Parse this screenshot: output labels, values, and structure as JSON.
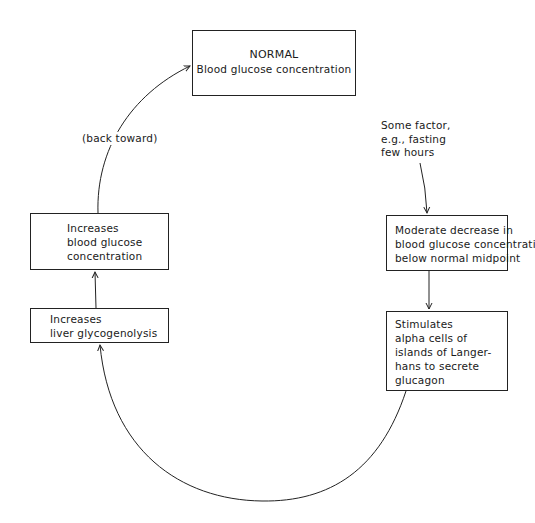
{
  "diagram": {
    "type": "feedback-loop",
    "nodes": {
      "normal": {
        "title": "NORMAL",
        "subtitle": "Blood glucose concentration"
      },
      "trigger": {
        "lines": [
          "Some factor,",
          "e.g., fasting",
          "few hours"
        ]
      },
      "decrease": {
        "lines": [
          "Moderate decrease in",
          "blood glucose concentration",
          "below normal midpoint"
        ]
      },
      "stimulates": {
        "lines": [
          "Stimulates",
          "alpha cells of",
          "islands of Langer-",
          "hans to secrete",
          "glucagon"
        ]
      },
      "glycogenolysis": {
        "lines": [
          "Increases",
          "liver glycogenolysis"
        ]
      },
      "increases_bg": {
        "lines": [
          "Increases",
          "blood glucose",
          "concentration"
        ]
      }
    },
    "edge_labels": {
      "back_toward": "(back toward)"
    },
    "edges": [
      {
        "from": "trigger",
        "to": "decrease"
      },
      {
        "from": "decrease",
        "to": "stimulates"
      },
      {
        "from": "stimulates",
        "to": "glycogenolysis"
      },
      {
        "from": "glycogenolysis",
        "to": "increases_bg"
      },
      {
        "from": "increases_bg",
        "to": "normal",
        "label": "(back toward)"
      }
    ],
    "colors": {
      "line": "#222222",
      "background": "#ffffff",
      "text": "#1a1a1a"
    }
  }
}
